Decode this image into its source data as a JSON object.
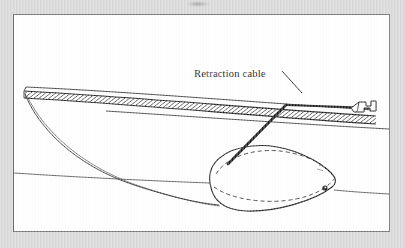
{
  "figure": {
    "kind": "technical-line-drawing",
    "panel_background": "#ffffff",
    "page_background": "#d9d9d9",
    "border_color": "#6f6f6f",
    "ink_color": "#1b1b1b",
    "labels": [
      {
        "id": "retraction-cable",
        "text": "Retraction cable",
        "x": 193,
        "y": 72,
        "leader": {
          "from_x": 281,
          "from_y": 68,
          "to_x": 300,
          "to_y": 90
        }
      }
    ],
    "parts": [
      {
        "id": "wing-hatched-spar",
        "description": "tapered hatched band running left to right"
      },
      {
        "id": "fuselage-underside-curve",
        "description": "long sweeping curve from wing tip to pod"
      },
      {
        "id": "gear-pod",
        "description": "ellipsoidal wheel fairing with hidden-line ellipse"
      },
      {
        "id": "retraction-cable-line",
        "description": "thick cable from elbow down into pod"
      },
      {
        "id": "pod-eyelet",
        "description": "small filled circle at pod nose"
      },
      {
        "id": "wing-root-fitting",
        "description": "bracket detail at right edge"
      }
    ]
  }
}
